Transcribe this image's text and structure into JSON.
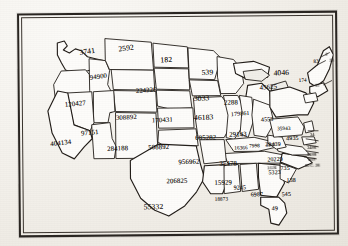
{
  "document": {
    "kind": "scanned-map",
    "title": "United States map with numeric value printed in each state",
    "background_color": "#f3f1ec",
    "ink_color": "#241f1b",
    "frame": {
      "style": "double-rule rectangle",
      "color": "#2a2622"
    }
  },
  "map": {
    "projection_note": "contiguous United States outline, photocopy quality",
    "states": [
      {
        "name": "washington",
        "value": "3741",
        "x": 62,
        "y": 34,
        "size": "sz-lg",
        "rotate": -8
      },
      {
        "name": "montana",
        "value": "2592",
        "x": 101,
        "y": 31,
        "size": "sz-lg",
        "rotate": -7
      },
      {
        "name": "north-dakota",
        "value": "182",
        "x": 143,
        "y": 43,
        "size": "sz-lg",
        "rotate": -3
      },
      {
        "name": "minnesota",
        "value": "539",
        "x": 184,
        "y": 56,
        "size": "sz-lg",
        "rotate": -2
      },
      {
        "name": "idaho",
        "value": "94900",
        "x": 72,
        "y": 60,
        "size": "sz-md",
        "rotate": -7
      },
      {
        "name": "oregon",
        "value": "120427",
        "x": 47,
        "y": 87,
        "size": "sz-md",
        "rotate": -5
      },
      {
        "name": "wyoming",
        "value": "224226",
        "x": 118,
        "y": 74,
        "size": "sz-md",
        "rotate": -3
      },
      {
        "name": "south-dakota",
        "value": "3033",
        "x": 176,
        "y": 82,
        "size": "sz-lg",
        "rotate": -2
      },
      {
        "name": "nebraska",
        "value": "46183",
        "x": 176,
        "y": 101,
        "size": "sz-lg",
        "rotate": -1
      },
      {
        "name": "iowa",
        "value": "2288",
        "x": 206,
        "y": 87,
        "size": "sz-md",
        "rotate": -1
      },
      {
        "name": "utah",
        "value": "308892",
        "x": 98,
        "y": 101,
        "size": "sz-md",
        "rotate": -3
      },
      {
        "name": "colorado",
        "value": "170431",
        "x": 134,
        "y": 104,
        "size": "sz-md",
        "rotate": -2
      },
      {
        "name": "nevada",
        "value": "97151",
        "x": 63,
        "y": 116,
        "size": "sz-md",
        "rotate": -5
      },
      {
        "name": "california",
        "value": "404134",
        "x": 32,
        "y": 126,
        "size": "sz-md",
        "rotate": -6
      },
      {
        "name": "arizona",
        "value": "284188",
        "x": 89,
        "y": 132,
        "size": "sz-md",
        "rotate": -2
      },
      {
        "name": "new-mexico",
        "value": "508892",
        "x": 130,
        "y": 131,
        "size": "sz-md",
        "rotate": -1
      },
      {
        "name": "kansas",
        "value": "685282",
        "x": 177,
        "y": 122,
        "size": "sz-md",
        "rotate": -1
      },
      {
        "name": "missouri",
        "value": "29143",
        "x": 211,
        "y": 119,
        "size": "sz-md",
        "rotate": -1
      },
      {
        "name": "wisconsin",
        "value": "179861",
        "x": 213,
        "y": 99,
        "size": "sz-sm",
        "rotate": -4
      },
      {
        "name": "michigan",
        "value": "4553",
        "x": 243,
        "y": 105,
        "size": "sz-sm",
        "rotate": -2
      },
      {
        "name": "illinois",
        "value": "16366",
        "x": 216,
        "y": 133,
        "size": "sz-xs",
        "rotate": -1
      },
      {
        "name": "indiana",
        "value": "7998",
        "x": 231,
        "y": 131,
        "size": "sz-xs",
        "rotate": -1
      },
      {
        "name": "ohio",
        "value": "29439",
        "x": 247,
        "y": 130,
        "size": "sz-sm",
        "rotate": -1
      },
      {
        "name": "oklahoma",
        "value": "956962",
        "x": 160,
        "y": 146,
        "size": "sz-md",
        "rotate": -1
      },
      {
        "name": "arkansas",
        "value": "35478",
        "x": 201,
        "y": 148,
        "size": "sz-md",
        "rotate": -1
      },
      {
        "name": "kentucky",
        "value": "20229",
        "x": 249,
        "y": 145,
        "size": "sz-sm",
        "rotate": -2
      },
      {
        "name": "tennessee",
        "value": "5323",
        "x": 250,
        "y": 158,
        "size": "sz-sm",
        "rotate": -1
      },
      {
        "name": "texas-north",
        "value": "206825",
        "x": 148,
        "y": 165,
        "size": "sz-md",
        "rotate": -1
      },
      {
        "name": "louisiana",
        "value": "15929",
        "x": 196,
        "y": 167,
        "size": "sz-md",
        "rotate": -1
      },
      {
        "name": "texas",
        "value": "55332",
        "x": 125,
        "y": 190,
        "size": "sz-lg",
        "rotate": -1
      },
      {
        "name": "mississippi",
        "value": "18873",
        "x": 196,
        "y": 184,
        "size": "sz-xs",
        "rotate": -1
      },
      {
        "name": "alabama",
        "value": "9245",
        "x": 215,
        "y": 173,
        "size": "sz-sm",
        "rotate": -1
      },
      {
        "name": "georgia-west",
        "value": "6987",
        "x": 232,
        "y": 180,
        "size": "sz-sm",
        "rotate": -1
      },
      {
        "name": "south-carolina",
        "value": "545",
        "x": 263,
        "y": 180,
        "size": "sz-sm",
        "rotate": -1
      },
      {
        "name": "north-carolina",
        "value": "138",
        "x": 268,
        "y": 166,
        "size": "sz-sm",
        "rotate": -1
      },
      {
        "name": "virginia",
        "value": "735",
        "x": 262,
        "y": 154,
        "size": "sz-sm",
        "rotate": -1
      },
      {
        "name": "florida",
        "value": "49",
        "x": 253,
        "y": 194,
        "size": "sz-sm",
        "rotate": -1
      },
      {
        "name": "west-virginia",
        "value": "3126",
        "x": 249,
        "y": 154,
        "size": "sz-xxs",
        "rotate": -2
      },
      {
        "name": "pennsylvania",
        "value": "35943",
        "x": 259,
        "y": 114,
        "size": "sz-xs",
        "rotate": -2
      },
      {
        "name": "new-york",
        "value": "4046",
        "x": 256,
        "y": 57,
        "size": "sz-lg",
        "rotate": -2
      },
      {
        "name": "maine",
        "value": "83",
        "x": 296,
        "y": 47,
        "size": "sz-xs",
        "rotate": -2
      },
      {
        "name": "vermont",
        "value": "2",
        "x": 308,
        "y": 41,
        "size": "sz-xxs",
        "rotate": -2
      },
      {
        "name": "new-hampshire",
        "value": "23",
        "x": 312,
        "y": 47,
        "size": "sz-xxs",
        "rotate": -2
      },
      {
        "name": "massachusetts",
        "value": "174",
        "x": 281,
        "y": 66,
        "size": "sz-xs",
        "rotate": -2
      },
      {
        "name": "connecticut",
        "value": "15",
        "x": 297,
        "y": 72,
        "size": "sz-xxs",
        "rotate": -2
      },
      {
        "name": "ohio-east",
        "value": "4935",
        "x": 268,
        "y": 124,
        "size": "sz-sm",
        "rotate": -1
      },
      {
        "name": "new-jersey",
        "value": "34",
        "x": 292,
        "y": 121,
        "size": "sz-xxs",
        "rotate": -1
      },
      {
        "name": "maryland",
        "value": "3486",
        "x": 289,
        "y": 134,
        "size": "sz-xxs",
        "rotate": -1
      },
      {
        "name": "delaware",
        "value": "9188",
        "x": 289,
        "y": 141,
        "size": "sz-xxs",
        "rotate": -1
      },
      {
        "name": "rhode-island",
        "value": "209",
        "x": 290,
        "y": 146,
        "size": "sz-xxs",
        "rotate": -1
      },
      {
        "name": "district-of-columbia",
        "value": "D.C. 28",
        "x": 287,
        "y": 152,
        "size": "sz-xxs",
        "rotate": -1
      },
      {
        "name": "michigan-upper",
        "value": "45625",
        "x": 242,
        "y": 72,
        "size": "sz-md",
        "rotate": -3
      },
      {
        "name": "east-small-1",
        "value": "5439",
        "x": 248,
        "y": 131,
        "size": "sz-xxs",
        "rotate": -1
      }
    ]
  }
}
